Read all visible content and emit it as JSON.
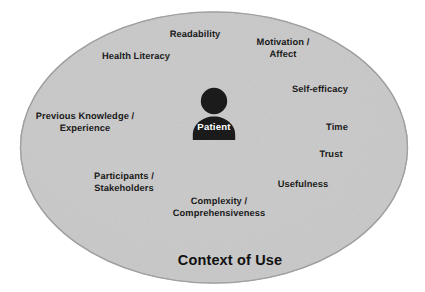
{
  "diagram": {
    "title": "Context of Use",
    "center_entity": {
      "label": "Patient",
      "icon": "person-icon"
    },
    "colors": {
      "ellipse_fill": "#c9c9c9",
      "ellipse_stroke": "#a5a5a5",
      "label_text": "#1a1a1a",
      "center_icon": "#1b1b1b",
      "center_label_text": "#ffffff",
      "background": "#ffffff"
    },
    "factors": [
      {
        "label": "Readability",
        "x": 195,
        "y": 35
      },
      {
        "label": "Motivation /\nAffect",
        "x": 283,
        "y": 48
      },
      {
        "label": "Health Literacy",
        "x": 136,
        "y": 57
      },
      {
        "label": "Self-efficacy",
        "x": 320,
        "y": 90
      },
      {
        "label": "Previous Knowledge /\nExperience",
        "x": 85,
        "y": 122
      },
      {
        "label": "Time",
        "x": 337,
        "y": 128
      },
      {
        "label": "Trust",
        "x": 331,
        "y": 155
      },
      {
        "label": "Participants /\nStakeholders",
        "x": 124,
        "y": 182
      },
      {
        "label": "Usefulness",
        "x": 303,
        "y": 185
      },
      {
        "label": "Complexity /\nComprehensiveness",
        "x": 219,
        "y": 207
      }
    ],
    "title_position": {
      "x": 230,
      "y": 260
    }
  }
}
